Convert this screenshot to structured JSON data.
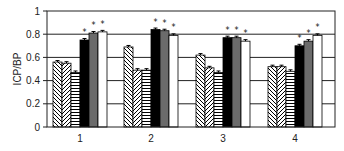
{
  "chart_data": {
    "type": "bar",
    "title": "",
    "xlabel": "",
    "ylabel": "ICP/BP",
    "ylim": [
      0,
      1
    ],
    "yticks": [
      "0",
      "0.2",
      "0.4",
      "0.6",
      "0.8",
      "1"
    ],
    "grid": true,
    "legend": null,
    "categories": [
      "1",
      "2",
      "3",
      "4"
    ],
    "series": [
      {
        "name": "series-1",
        "pattern": "diagonal-backslash",
        "values": [
          0.56,
          0.69,
          0.62,
          0.52
        ],
        "significant": [
          false,
          false,
          false,
          false
        ]
      },
      {
        "name": "series-2",
        "pattern": "diagonal-slash",
        "values": [
          0.55,
          0.49,
          0.51,
          0.52
        ],
        "significant": [
          false,
          false,
          false,
          false
        ]
      },
      {
        "name": "series-3",
        "pattern": "horizontal-stripes",
        "values": [
          0.47,
          0.49,
          0.47,
          0.48
        ],
        "significant": [
          false,
          false,
          false,
          false
        ]
      },
      {
        "name": "series-4",
        "pattern": "solid-black",
        "values": [
          0.75,
          0.84,
          0.77,
          0.7
        ],
        "significant": [
          true,
          true,
          true,
          true
        ]
      },
      {
        "name": "series-5",
        "pattern": "solid-gray",
        "values": [
          0.81,
          0.83,
          0.77,
          0.74
        ],
        "significant": [
          true,
          true,
          true,
          true
        ]
      },
      {
        "name": "series-6",
        "pattern": "solid-white",
        "values": [
          0.82,
          0.79,
          0.74,
          0.79
        ],
        "significant": [
          true,
          true,
          true,
          true
        ]
      }
    ],
    "annotation_symbol": "*",
    "colors": {
      "black": "#000000",
      "gray": "#6b6b6b",
      "white": "#ffffff",
      "axis": "#222222"
    }
  }
}
